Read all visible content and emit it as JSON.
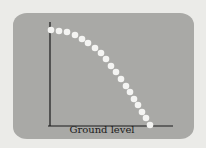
{
  "figure": {
    "axis_label": "Ground level",
    "colors": {
      "screen": "#a9a9a6",
      "background": "#ebebe8",
      "dots": "#f4f4f2",
      "axes": "#1a1a1a"
    },
    "dot_count": 19
  },
  "chart_data": {
    "type": "scatter",
    "title": "",
    "xlabel": "Ground level",
    "ylabel": "",
    "grid": false,
    "points_px": [
      [
        51,
        30
      ],
      [
        59,
        31
      ],
      [
        67,
        32
      ],
      [
        75,
        35
      ],
      [
        82,
        39
      ],
      [
        88,
        43
      ],
      [
        95,
        48
      ],
      [
        101,
        53
      ],
      [
        106,
        59
      ],
      [
        111,
        66
      ],
      [
        116,
        72
      ],
      [
        121,
        79
      ],
      [
        126,
        86
      ],
      [
        130,
        92
      ],
      [
        134,
        99
      ],
      [
        138,
        105
      ],
      [
        142,
        112
      ],
      [
        146,
        118
      ],
      [
        150,
        125
      ]
    ]
  }
}
